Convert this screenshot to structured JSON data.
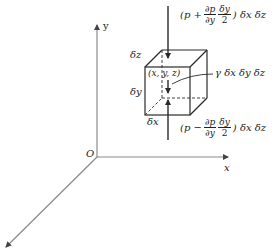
{
  "diagram": {
    "axes": {
      "x_label": "x",
      "y_label": "y",
      "origin_label": "O"
    },
    "element": {
      "point_label": "(x, y, z)",
      "dx_label": "δx",
      "dy_label": "δy",
      "dz_label": "δz",
      "weight_label": "γ δx δy δz"
    },
    "top_force": {
      "open": "(p +",
      "num1": "∂p",
      "den1": "∂y",
      "num2": "δy",
      "den2": "2",
      "close": ") δx δz"
    },
    "bottom_force": {
      "open": "(p −",
      "num1": "∂p",
      "den1": "∂y",
      "num2": "δy",
      "den2": "2",
      "close": ") δx δz"
    },
    "colors": {
      "axis": "#8a8a8a",
      "line": "#2a2a2a",
      "text": "#1a1a1a"
    }
  }
}
